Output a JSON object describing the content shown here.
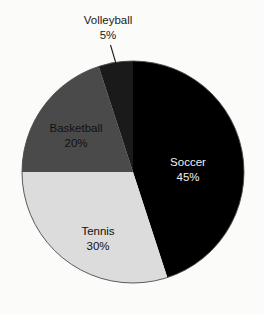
{
  "background_color": "#fbfbfa",
  "chart_data": {
    "type": "pie",
    "title": "",
    "subtitle": "",
    "xlabel": "",
    "ylabel": "",
    "grid": false,
    "legend": "none",
    "labels_position": "inside-slice, except Volleyball which uses an external label with leader line",
    "start_angle_deg": 0,
    "direction": "clockwise",
    "total": 100,
    "categories": [
      "Soccer",
      "Tennis",
      "Basketball",
      "Volleyball"
    ],
    "values": [
      45,
      30,
      20,
      5
    ],
    "value_labels": [
      "45%",
      "30%",
      "20%",
      "5%"
    ],
    "colors": [
      "#000000",
      "#dcdcdc",
      "#4a4a4a",
      "#1a1a1a"
    ],
    "slices": [
      {
        "name": "Soccer",
        "value": 45,
        "value_label": "45%",
        "color": "#000000",
        "label_color": "#f2f2f2",
        "label_placement": "inside"
      },
      {
        "name": "Tennis",
        "value": 30,
        "value_label": "30%",
        "color": "#dcdcdc",
        "label_color": "#111111",
        "label_placement": "inside"
      },
      {
        "name": "Basketball",
        "value": 20,
        "value_label": "20%",
        "color": "#4a4a4a",
        "label_color": "#111111",
        "label_placement": "inside"
      },
      {
        "name": "Volleyball",
        "value": 5,
        "value_label": "5%",
        "color": "#1a1a1a",
        "label_color": "#1a1a1a",
        "label_placement": "outside-with-leader-line"
      }
    ]
  },
  "geometry": {
    "center_x": 133,
    "center_y": 172,
    "radius": 111
  }
}
